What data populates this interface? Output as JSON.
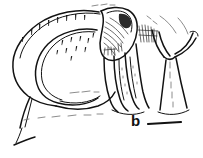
{
  "figure": {
    "panel_label": "b",
    "label_position": {
      "x": 131,
      "y": 113
    },
    "scale_bar": {
      "name": "scale-bar",
      "x1": 148,
      "y1": 124,
      "x2": 181,
      "y2": 122,
      "caption": ""
    },
    "canvas": {
      "width": 203,
      "height": 158
    },
    "background_color": "#ffffff",
    "ink_color": "#121212",
    "faint_ink_color": "#6f6f6f",
    "style": "pen-and-ink line drawing"
  }
}
